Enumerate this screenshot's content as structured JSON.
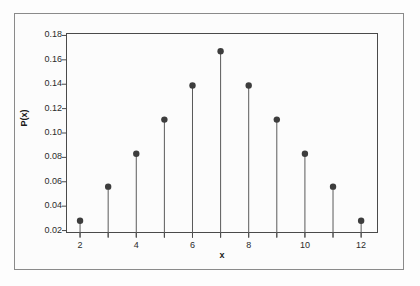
{
  "chart_data": {
    "type": "scatter",
    "title": "",
    "subtitle": "",
    "xlabel": "x",
    "ylabel": "P(x)",
    "x": [
      2,
      3,
      4,
      5,
      6,
      7,
      8,
      9,
      10,
      11,
      12
    ],
    "values": [
      0.028,
      0.056,
      0.083,
      0.111,
      0.139,
      0.167,
      0.139,
      0.111,
      0.083,
      0.056,
      0.028
    ],
    "series": [
      {
        "name": "P(x)",
        "values": [
          0.028,
          0.056,
          0.083,
          0.111,
          0.139,
          0.167,
          0.139,
          0.111,
          0.083,
          0.056,
          0.028
        ]
      }
    ],
    "xlim": [
      1.5,
      12.6
    ],
    "ylim": [
      0.018,
      0.182
    ],
    "xticks": [
      2,
      3,
      4,
      5,
      6,
      7,
      8,
      9,
      10,
      11,
      12
    ],
    "xtick_labels": [
      "2",
      "",
      "4",
      "",
      "6",
      "",
      "8",
      "",
      "10",
      "",
      "12"
    ],
    "yticks": [
      0.02,
      0.04,
      0.06,
      0.08,
      0.1,
      0.12,
      0.14,
      0.16,
      0.18
    ],
    "ytick_labels": [
      "0.02",
      "0.04",
      "0.06",
      "0.08",
      "0.10",
      "0.12",
      "0.14",
      "0.16",
      "0.18"
    ],
    "grid": false,
    "legend": false,
    "legend_position": "none",
    "marker": "filled-circle",
    "marker_color": "#3d3d3d",
    "stem_color": "#5a5a5a",
    "axis_color": "#4a4a4a",
    "frame_color": "#8a8a8a",
    "background_color": "#fcfcfc",
    "annotations": []
  }
}
